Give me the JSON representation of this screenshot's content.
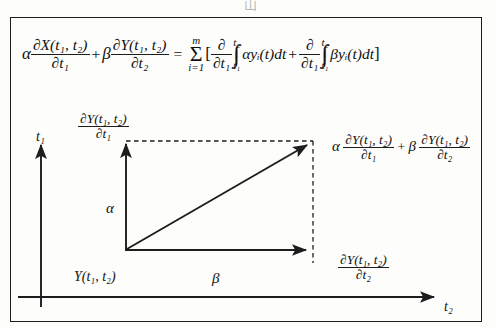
{
  "page": {
    "top_partial_glyph": "山"
  },
  "equation": {
    "lhs": {
      "alpha": "α",
      "term1": {
        "numerator": "∂X(t₁, t₂)",
        "denominator": "∂t₁"
      },
      "plus": "+",
      "beta": "β",
      "term2": {
        "numerator": "∂Y(t₁, t₂)",
        "denominator": "∂t₂"
      }
    },
    "equals": "=",
    "rhs": {
      "sum": {
        "upper": "m",
        "symbol": "Σ",
        "lower": "i=1"
      },
      "open_bracket": "[",
      "operator1": {
        "numerator": "∂",
        "denominator": "∂t₁"
      },
      "integral1": {
        "symbol": "∫",
        "upper": "t₂",
        "lower": "t₁",
        "integrand": "αyᵢ(t)dt"
      },
      "plus": "+",
      "operator2": {
        "numerator": "∂",
        "denominator": "∂t₁"
      },
      "integral2": {
        "symbol": "∫",
        "upper": "t₂",
        "lower": "t₁",
        "integrand": "βyᵢ(t)dt"
      },
      "close_bracket": "]"
    }
  },
  "diagram": {
    "axis_t1_label": "t₁",
    "axis_t2_label": "t₂",
    "origin_label": "Y(t₁, t₂)",
    "alpha_vector_label": "α",
    "beta_vector_label": "β",
    "top_label": {
      "numerator": "∂Y(t₁, t₂)",
      "denominator": "∂t₁"
    },
    "right_label": {
      "numerator": "∂Y(t₁, t₂)",
      "denominator": "∂t₂"
    },
    "resultant_label": {
      "alpha": "α",
      "term1": {
        "numerator": "∂Y(t₁, t₂)",
        "denominator": "∂t₁"
      },
      "plus": "+",
      "beta": "β",
      "term2": {
        "numerator": "∂Y(t₁, t₂)",
        "denominator": "∂t₂"
      }
    }
  },
  "colors": {
    "ink": "#1d1d1d",
    "paper": "#fdfdfc",
    "faint": "#b9b9b9"
  }
}
